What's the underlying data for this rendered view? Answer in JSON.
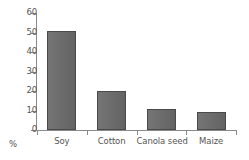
{
  "chart_data": {
    "type": "bar",
    "title": "",
    "subtitle": "",
    "xlabel": "",
    "ylabel": "%",
    "unit_label": "%",
    "categories": [
      "Soy",
      "Cotton",
      "Canola seed",
      "Maize"
    ],
    "values": [
      51,
      20,
      11,
      9
    ],
    "series": [
      {
        "name": "Share",
        "values": [
          51,
          20,
          11,
          9
        ]
      }
    ],
    "ylim": [
      0,
      60
    ],
    "ytick_labels": [
      "0",
      "10",
      "20",
      "30",
      "40",
      "50",
      "60"
    ],
    "ytick_values": [
      0,
      10,
      20,
      30,
      40,
      50,
      60
    ],
    "grid": false,
    "legend": false,
    "legend_position": "none",
    "annotations": [],
    "colors": {
      "bar_fill": "#6e6e6e",
      "bar_border": "#4a4a4a",
      "axis": "#8a8a8a",
      "text": "#555555",
      "background": "#ffffff"
    }
  }
}
